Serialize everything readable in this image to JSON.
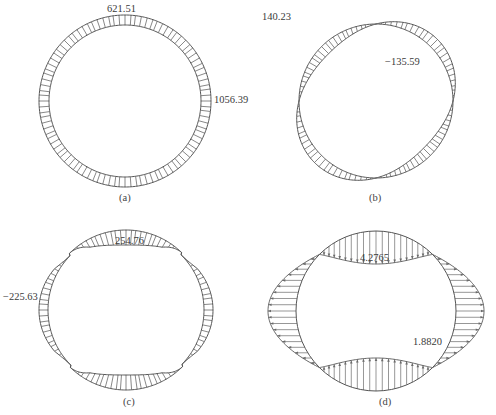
{
  "figure": {
    "panels": [
      {
        "id": "a",
        "caption": "(a)",
        "description": "Uniform ring distribution (axial force)",
        "labels": [
          {
            "text": "621.51",
            "x": 107,
            "y": 4
          },
          {
            "text": "1056.39",
            "x": 214,
            "y": 95
          }
        ],
        "caption_pos": {
          "x": 119,
          "y": 193
        },
        "shape": {
          "type": "ring",
          "cx": 125,
          "cy": 101,
          "r_in": 76,
          "r_out": 86,
          "n_ticks": 96
        }
      },
      {
        "id": "b",
        "caption": "(b)",
        "description": "Antisymmetric bending distribution (2-lobe, rotated)",
        "labels": [
          {
            "text": "140.23",
            "x": 262,
            "y": 12
          },
          {
            "text": "−135.59",
            "x": 385,
            "y": 57
          }
        ],
        "caption_pos": {
          "x": 369,
          "y": 193
        },
        "shape": {
          "type": "cos2",
          "cx": 376,
          "cy": 101,
          "r": 77,
          "amp": 10,
          "phase_deg": 45,
          "n_ticks": 96
        }
      },
      {
        "id": "c",
        "caption": "(c)",
        "description": "Symmetric distribution, positive at crown/invert, negative at sides",
        "labels": [
          {
            "text": "254.76",
            "x": 115,
            "y": 236
          },
          {
            "text": "−225.63",
            "x": 3,
            "y": 292
          }
        ],
        "caption_pos": {
          "x": 123,
          "y": 397
        },
        "shape": {
          "type": "cos2sym",
          "cx": 126,
          "cy": 310,
          "r": 80,
          "amp": 15,
          "n_ticks": 96
        }
      },
      {
        "id": "d",
        "caption": "(d)",
        "description": "Arrow (vector) distribution of pressure around lining",
        "labels": [
          {
            "text": "4.2765",
            "x": 360,
            "y": 253
          },
          {
            "text": "1.8820",
            "x": 413,
            "y": 337
          }
        ],
        "caption_pos": {
          "x": 379,
          "y": 397
        },
        "shape": {
          "type": "arrows",
          "cx": 376,
          "cy": 311,
          "r": 80,
          "amp_top": 33,
          "amp_side": 28,
          "n_ticks": 80
        }
      }
    ],
    "colors": {
      "stroke": "#555555",
      "hatch": "#6a6a6a",
      "text": "#333333"
    }
  }
}
